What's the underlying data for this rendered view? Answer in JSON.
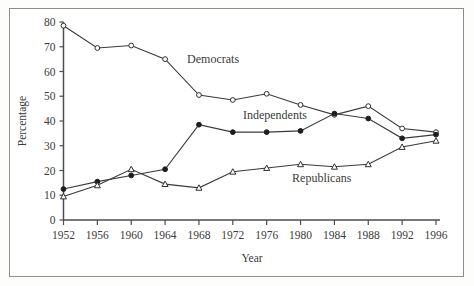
{
  "chart_data": {
    "type": "line",
    "title": "",
    "subtitle": "",
    "xlabel": "Year",
    "ylabel": "Percentage",
    "x": [
      1952,
      1956,
      1960,
      1964,
      1968,
      1972,
      1976,
      1980,
      1984,
      1988,
      1992,
      1996
    ],
    "categories": [
      "1952",
      "1956",
      "1960",
      "1964",
      "1968",
      "1972",
      "1976",
      "1980",
      "1984",
      "1988",
      "1992",
      "1996"
    ],
    "xlim": [
      1952,
      1996
    ],
    "ylim": [
      0,
      80
    ],
    "xticks": [
      "1952",
      "1956",
      "1960",
      "1964",
      "1968",
      "1972",
      "1976",
      "1980",
      "1984",
      "1988",
      "1992",
      "1996"
    ],
    "yticks": [
      "0",
      "10",
      "20",
      "30",
      "40",
      "50",
      "60",
      "70",
      "80"
    ],
    "ytick_values": [
      0,
      10,
      20,
      30,
      40,
      50,
      60,
      70,
      80
    ],
    "grid": false,
    "legend_position": "inline-annotations",
    "series": [
      {
        "name": "Democrats",
        "marker": "open-circle",
        "color": "#2f2f2f",
        "values": [
          78.5,
          69.5,
          70.5,
          65.0,
          50.5,
          48.5,
          51.0,
          46.5,
          42.5,
          46.0,
          37.0,
          35.5
        ],
        "label_x": 1966.6,
        "label_y": 63.5
      },
      {
        "name": "Independents",
        "marker": "filled-circle",
        "color": "#1d1d1d",
        "values": [
          12.5,
          15.5,
          18.0,
          20.5,
          38.5,
          35.5,
          35.5,
          36.0,
          43.0,
          41.0,
          33.0,
          34.5
        ],
        "label_x": 1973.2,
        "label_y": 41.0
      },
      {
        "name": "Republicans",
        "marker": "open-triangle",
        "color": "#2f2f2f",
        "values": [
          9.5,
          14.0,
          20.5,
          14.5,
          13.0,
          19.5,
          21.0,
          22.5,
          21.5,
          22.5,
          29.5,
          32.0
        ],
        "label_x": 1979.0,
        "label_y": 15.2
      }
    ]
  },
  "axes": {
    "y_title": "Percentage",
    "x_title": "Year"
  }
}
